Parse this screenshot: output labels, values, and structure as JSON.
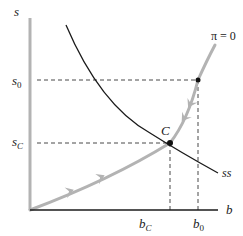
{
  "diagram": {
    "y_axis": {
      "label": "s"
    },
    "x_axis": {
      "label": "b"
    },
    "y_ticks": [
      {
        "main": "s",
        "sub": "0"
      },
      {
        "main": "s",
        "sub": "C"
      }
    ],
    "x_ticks": [
      {
        "main": "b",
        "sub": "C"
      },
      {
        "main": "b",
        "sub": "0"
      }
    ],
    "curves": {
      "pi_zero": {
        "label": "π = 0",
        "color": "#b3b3b3"
      },
      "ss": {
        "label": "ss",
        "color": "#1a1a1a"
      }
    },
    "points": {
      "equilibrium": {
        "label": "C"
      }
    },
    "colors": {
      "axis_y": "#b3b3b3",
      "axis_x": "#1a1a1a",
      "dashed": "#333333"
    }
  }
}
